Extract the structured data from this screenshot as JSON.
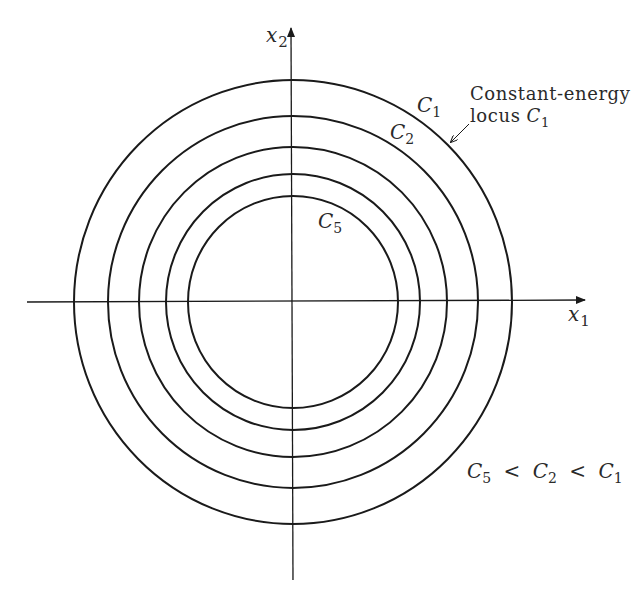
{
  "diagram": {
    "type": "phase-plane",
    "axes": {
      "x_label": "x",
      "x_sub": "1",
      "y_label": "x",
      "y_sub": "2"
    },
    "center": {
      "x": 293,
      "y": 302
    },
    "curves": [
      {
        "id": "C1",
        "rx": 219,
        "ry": 222,
        "label": "C",
        "sub": "1"
      },
      {
        "id": "C2",
        "rx": 185,
        "ry": 186,
        "label": "C",
        "sub": "2"
      },
      {
        "id": "C3",
        "rx": 154,
        "ry": 155,
        "label": "",
        "sub": ""
      },
      {
        "id": "C4",
        "rx": 127,
        "ry": 128,
        "label": "",
        "sub": ""
      },
      {
        "id": "C5",
        "rx": 105,
        "ry": 106,
        "label": "C",
        "sub": "5"
      }
    ],
    "annotation": {
      "line1": "Constant-energy",
      "line2": "locus",
      "line2_symbol": "C",
      "line2_sub": "1"
    },
    "inequality": {
      "parts": [
        {
          "sym": "C",
          "sub": "5"
        },
        {
          "op": "<"
        },
        {
          "sym": "C",
          "sub": "2"
        },
        {
          "op": "<"
        },
        {
          "sym": "C",
          "sub": "1"
        }
      ]
    },
    "colors": {
      "line": "#1a1a1a",
      "text": "#2a2a2a",
      "background": "#ffffff"
    }
  }
}
